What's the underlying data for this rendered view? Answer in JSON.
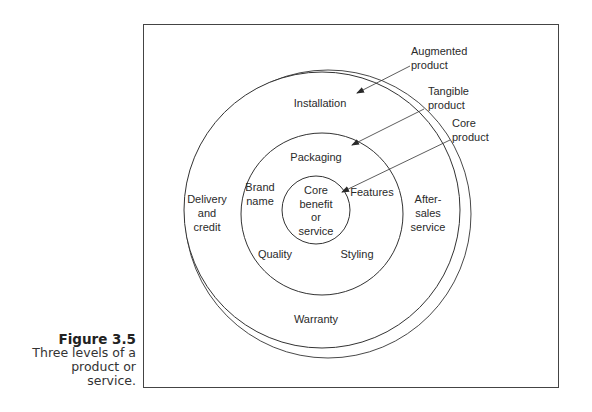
{
  "figure": {
    "number": "Figure 3.5",
    "caption_lines": [
      "Three levels of a",
      "product or",
      "service."
    ]
  },
  "diagram": {
    "levels": {
      "augmented": {
        "label_lines": [
          "Augmented",
          "product"
        ]
      },
      "tangible": {
        "label_lines": [
          "Tangible",
          "product"
        ]
      },
      "core": {
        "label_lines": [
          "Core",
          "product"
        ]
      }
    },
    "core_circle_lines": [
      "Core",
      "benefit",
      "or",
      "service"
    ],
    "tangible_ring_items": {
      "packaging": "Packaging",
      "brand_name": [
        "Brand",
        "name"
      ],
      "features": "Features",
      "quality": "Quality",
      "styling": "Styling"
    },
    "augmented_ring_items": {
      "installation": "Installation",
      "delivery_credit": [
        "Delivery",
        "and",
        "credit"
      ],
      "after_sales": [
        "After-",
        "sales",
        "service"
      ],
      "warranty": "Warranty"
    }
  }
}
